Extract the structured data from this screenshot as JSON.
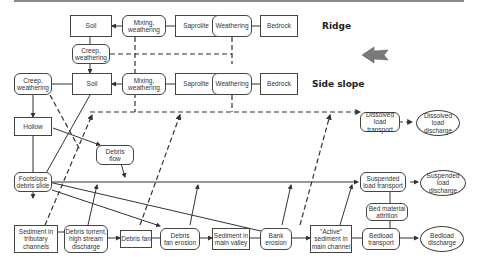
{
  "zones": {
    "ridge": "Ridge",
    "side_slope": "Side slope"
  },
  "direction_arrow": {
    "icon": "left-arrow-icon",
    "color": "#7a7a7a"
  },
  "nodes": {
    "ridge_soil": "Soil",
    "ridge_mixing": "Mixing,\nweathering",
    "ridge_saprolite": "Saprolite",
    "ridge_weathering": "Weathering",
    "ridge_bedrock": "Bedrock",
    "ridge_creep": "Creep,\nweathering",
    "side_creep": "Creep,\nweathering",
    "side_soil": "Soil",
    "side_mixing": "Mixing,\nweathering",
    "side_saprolite": "Saprolite",
    "side_weathering": "Weathering",
    "side_bedrock": "Bedrock",
    "hollow": "Hollow",
    "debris_flow": "Debris\nflow",
    "footslope": "Footslope\ndebris slide",
    "sediment_tributary": "Sediment in\ntributary\nchannels",
    "debris_torrent": "Debris torrent,\nhigh stream\ndischarge",
    "debris_fan": "Debris fan",
    "debris_fan_erosion": "Debris\nfan erosion",
    "sediment_valley": "Sediment in\nmain valley",
    "bank_erosion": "Bank\nerosion",
    "active_sediment": "\"Active\"\nsediment in\nmain channel",
    "dissolved_transport": "Dissolved\nload transport",
    "dissolved_discharge": "Dissolved\nload\ndischarge",
    "suspended_transport": "Suspended\nload transport",
    "suspended_discharge": "Suspended\nload\ndischarge",
    "bed_attrition": "Bed material\nattrition",
    "bedload_transport": "Bedload\ntransport",
    "bedload_discharge": "Bedload\ndischarge"
  },
  "colors": {
    "line": "#333333",
    "border": "#444444",
    "top_rule": "#8a8a8a"
  }
}
